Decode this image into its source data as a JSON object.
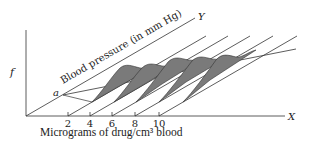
{
  "diagram": {
    "vertical_axis_label": "f",
    "x_axis_label": "X",
    "y_axis_label": "Y",
    "diagonal_axis_title": "Blood pressure (in mm Hg)",
    "point_label": "a",
    "caption": "Micrograms of drug/cm³ blood",
    "x_ticks": [
      "2",
      "4",
      "6",
      "8",
      "10"
    ],
    "curve_fill_color": "#7a7a7a",
    "line_color": "#333333"
  }
}
